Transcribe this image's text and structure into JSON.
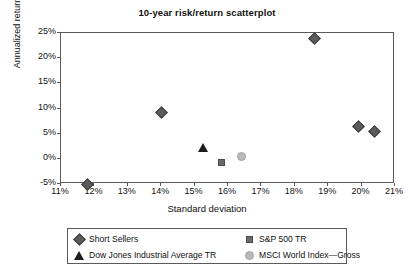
{
  "chart_data": {
    "type": "scatter",
    "title": "10-year risk/return scatterplot",
    "xlabel": "Standard deviation",
    "ylabel": "Annualized return",
    "xlim": [
      11,
      21
    ],
    "ylim": [
      -5,
      25
    ],
    "x_ticks": [
      "11%",
      "12%",
      "13%",
      "14%",
      "15%",
      "16%",
      "17%",
      "18%",
      "19%",
      "20%",
      "21%"
    ],
    "x_tick_values": [
      11,
      12,
      13,
      14,
      15,
      16,
      17,
      18,
      19,
      20,
      21
    ],
    "y_ticks": [
      "-5%",
      "0%",
      "5%",
      "10%",
      "15%",
      "20%",
      "25%"
    ],
    "y_tick_values": [
      -5,
      0,
      5,
      10,
      15,
      20,
      25
    ],
    "grid": false,
    "legend_position": "bottom",
    "series": [
      {
        "name": "Short Sellers",
        "marker": "diamond",
        "color": "#5b5b5b",
        "points": [
          {
            "x": 11.8,
            "y": -5.0
          },
          {
            "x": 14.0,
            "y": 9.2
          },
          {
            "x": 18.6,
            "y": 24.0
          },
          {
            "x": 19.9,
            "y": 6.4
          },
          {
            "x": 20.4,
            "y": 5.5
          }
        ]
      },
      {
        "name": "S&P 500 TR",
        "marker": "square",
        "color": "#6a6a6a",
        "points": [
          {
            "x": 15.8,
            "y": -0.7
          }
        ]
      },
      {
        "name": "Dow Jones Industrial Average TR",
        "marker": "triangle",
        "color": "#1c1c1c",
        "points": [
          {
            "x": 15.25,
            "y": 2.2
          }
        ]
      },
      {
        "name": "MSCI World Index—Gross",
        "marker": "circle",
        "color": "#b9b9b9",
        "points": [
          {
            "x": 16.4,
            "y": 0.5
          }
        ]
      }
    ]
  },
  "legend": {
    "entries": [
      {
        "label": "Short Sellers",
        "marker": "diamond"
      },
      {
        "label": "S&P 500 TR",
        "marker": "square"
      },
      {
        "label": "Dow Jones Industrial Average TR",
        "marker": "triangle"
      },
      {
        "label": "MSCI World Index—Gross",
        "marker": "circle"
      }
    ]
  },
  "colors": {
    "axis": "#5a5a5a",
    "text": "#111111",
    "background": "#ffffff"
  }
}
